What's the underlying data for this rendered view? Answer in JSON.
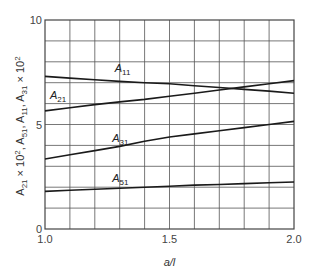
{
  "chart_data": {
    "type": "line",
    "title": "",
    "xlabel": "a/l",
    "ylabel": "A21 × 10², A51, A11, A31 × 10²",
    "xlim": [
      1.0,
      2.0
    ],
    "ylim": [
      0,
      10
    ],
    "x_ticks": [
      "1.0",
      "1.5",
      "2.0"
    ],
    "y_ticks": [
      "0",
      "5",
      "10"
    ],
    "grid": true,
    "grid_x_step": 0.1,
    "grid_y_step": 1,
    "legend_position": "inline labels",
    "x": [
      1.0,
      1.1,
      1.2,
      1.3,
      1.4,
      1.5,
      1.6,
      1.7,
      1.8,
      1.9,
      2.0
    ],
    "series": [
      {
        "name": "A11",
        "label_main": "A",
        "label_sub": "11",
        "label_pos": [
          1.28,
          7.5
        ],
        "values": [
          7.3,
          7.22,
          7.14,
          7.06,
          7.0,
          6.95,
          6.85,
          6.77,
          6.68,
          6.6,
          6.5
        ]
      },
      {
        "name": "A21",
        "label_main": "A",
        "label_sub": "21",
        "label_pos": [
          1.02,
          6.2
        ],
        "values": [
          5.65,
          5.8,
          5.95,
          6.08,
          6.2,
          6.35,
          6.5,
          6.65,
          6.8,
          6.95,
          7.1
        ]
      },
      {
        "name": "A31",
        "label_main": "A",
        "label_sub": "31",
        "label_pos": [
          1.27,
          4.15
        ],
        "values": [
          3.35,
          3.55,
          3.75,
          3.95,
          4.2,
          4.4,
          4.55,
          4.7,
          4.85,
          5.0,
          5.15
        ]
      },
      {
        "name": "A51",
        "label_main": "A",
        "label_sub": "51",
        "label_pos": [
          1.27,
          2.25
        ],
        "values": [
          1.8,
          1.85,
          1.9,
          1.95,
          2.0,
          2.05,
          2.1,
          2.13,
          2.17,
          2.21,
          2.25
        ]
      }
    ]
  },
  "axes": {
    "x_title": "a/l",
    "y_title_parts": [
      "A",
      "21",
      " × 10",
      "2",
      ", A",
      "51",
      ", A",
      "11",
      ", A",
      "31",
      " × 10",
      "2"
    ]
  },
  "colors": {
    "line": "#1a1a1a",
    "grid": "#555555",
    "frame": "#444444"
  }
}
